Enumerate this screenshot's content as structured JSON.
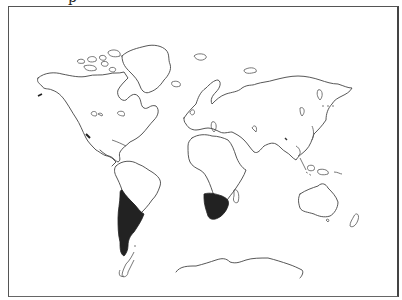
{
  "title_fragment": "p",
  "map": {
    "type": "world-outline",
    "highlight_color": "#222222",
    "outline_color": "#444444",
    "background": "#ffffff",
    "highlighted_regions": [
      {
        "name": "Southern South America (Chile, Argentina)"
      },
      {
        "name": "Southern Africa"
      }
    ]
  }
}
